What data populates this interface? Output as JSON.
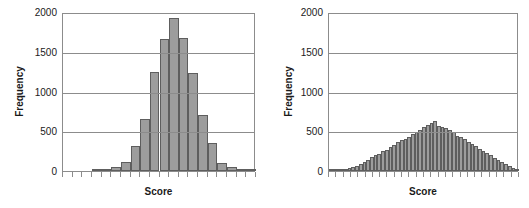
{
  "figure": {
    "background": "#ffffff",
    "bar_fill": "#9d9d9d",
    "bar_stroke": "#5e5e5e",
    "axis_color": "#8c8c8c",
    "text_color": "#1a1a1a"
  },
  "chart_data": [
    {
      "type": "bar",
      "title": "",
      "panel": "left",
      "xlabel": "Score",
      "ylabel": "Frequency",
      "ylim": [
        0,
        2000
      ],
      "yticks": [
        0,
        500,
        1000,
        1500,
        2000
      ],
      "ytick_labels": [
        "0",
        "500",
        "1000",
        "1500",
        "2000"
      ],
      "grid": true,
      "xtick_count": 20,
      "xtick_labels": [],
      "categories": [
        "b1",
        "b2",
        "b3",
        "b4",
        "b5",
        "b6",
        "b7",
        "b8",
        "b9",
        "b10",
        "b11",
        "b12",
        "b13",
        "b14",
        "b15",
        "b16",
        "b17",
        "b18",
        "b19",
        "b20"
      ],
      "values": [
        0,
        0,
        0,
        10,
        20,
        45,
        110,
        320,
        660,
        1240,
        1660,
        1920,
        1670,
        1230,
        710,
        350,
        95,
        45,
        20,
        10
      ]
    },
    {
      "type": "bar",
      "title": "",
      "panel": "right",
      "xlabel": "Score",
      "ylabel": "Frequency",
      "ylim": [
        0,
        2000
      ],
      "yticks": [
        0,
        500,
        1000,
        1500,
        2000
      ],
      "ytick_labels": [
        "0",
        "500",
        "1000",
        "1500",
        "2000"
      ],
      "grid": true,
      "xtick_count": 26,
      "xtick_labels": [],
      "categories": [
        "c1",
        "c2",
        "c3",
        "c4",
        "c5",
        "c6",
        "c7",
        "c8",
        "c9",
        "c10",
        "c11",
        "c12",
        "c13",
        "c14",
        "c15",
        "c16",
        "c17",
        "c18",
        "c19",
        "c20",
        "c21",
        "c22",
        "c23",
        "c24",
        "c25",
        "c26",
        "c27",
        "c28",
        "c29",
        "c30",
        "c31",
        "c32",
        "c33",
        "c34",
        "c35",
        "c36",
        "c37",
        "c38",
        "c39",
        "c40",
        "c41",
        "c42",
        "c43",
        "c44",
        "c45",
        "c46",
        "c47",
        "c48",
        "c49",
        "c50",
        "c51"
      ],
      "values": [
        12,
        14,
        18,
        22,
        28,
        38,
        50,
        65,
        85,
        110,
        140,
        175,
        200,
        215,
        250,
        270,
        300,
        330,
        360,
        390,
        400,
        430,
        460,
        490,
        520,
        555,
        580,
        600,
        625,
        560,
        555,
        540,
        520,
        495,
        440,
        430,
        400,
        370,
        345,
        310,
        280,
        250,
        225,
        200,
        170,
        140,
        110,
        85,
        60,
        40,
        22
      ]
    }
  ],
  "labels": {
    "left_ylabel": "Frequency",
    "left_xlabel": "Score",
    "right_ylabel": "Frequency",
    "right_xlabel": "Score"
  }
}
